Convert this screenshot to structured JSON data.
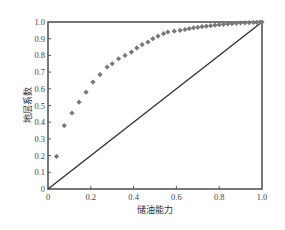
{
  "chart_data": {
    "type": "scatter",
    "title": "",
    "xlabel": "储油能力",
    "ylabel": "地层系数",
    "xlim": [
      0,
      1.0
    ],
    "ylim": [
      0,
      1.0
    ],
    "grid": false,
    "legend": null,
    "x_ticks": [
      "0",
      "0.2",
      "0.4",
      "0.6",
      "0.8",
      "1.0"
    ],
    "y_ticks": [
      "0",
      "0.1",
      "0.2",
      "0.3",
      "0.4",
      "0.5",
      "0.6",
      "0.7",
      "0.8",
      "0.9",
      "1.0"
    ],
    "series": [
      {
        "name": "curve-points",
        "marker": "diamond",
        "color": "#777777",
        "x": [
          0.04,
          0.076,
          0.112,
          0.145,
          0.178,
          0.21,
          0.243,
          0.276,
          0.3,
          0.33,
          0.36,
          0.39,
          0.415,
          0.44,
          0.467,
          0.49,
          0.514,
          0.54,
          0.56,
          0.59,
          0.617,
          0.64,
          0.66,
          0.68,
          0.7,
          0.72,
          0.74,
          0.76,
          0.78,
          0.8,
          0.82,
          0.84,
          0.86,
          0.88,
          0.9,
          0.92,
          0.94,
          0.96,
          0.975,
          0.99,
          1.0
        ],
        "y": [
          0.195,
          0.38,
          0.455,
          0.52,
          0.58,
          0.64,
          0.685,
          0.73,
          0.75,
          0.78,
          0.8,
          0.82,
          0.845,
          0.865,
          0.88,
          0.9,
          0.915,
          0.93,
          0.94,
          0.945,
          0.95,
          0.955,
          0.96,
          0.965,
          0.968,
          0.972,
          0.975,
          0.978,
          0.981,
          0.984,
          0.986,
          0.988,
          0.99,
          0.992,
          0.994,
          0.995,
          0.996,
          0.997,
          0.998,
          0.999,
          1.0
        ]
      },
      {
        "name": "diagonal",
        "type": "line",
        "color": "#333333",
        "x": [
          0,
          1.0
        ],
        "y": [
          0,
          1.0
        ]
      }
    ]
  },
  "layout": {
    "plot_left": 48,
    "plot_top": 22,
    "plot_width": 214,
    "plot_height": 167
  }
}
